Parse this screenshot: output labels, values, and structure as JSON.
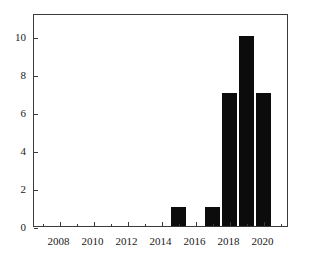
{
  "chart_data": {
    "type": "bar",
    "title": "",
    "subtitle": "",
    "xlabel": "",
    "ylabel": "",
    "categories": [
      2015,
      2017,
      2018,
      2019,
      2020
    ],
    "values": [
      1,
      1,
      7,
      10,
      7
    ],
    "series": [
      {
        "name": "count",
        "values": [
          1,
          1,
          7,
          10,
          7
        ]
      }
    ],
    "bars": [
      {
        "x": 2015,
        "value": 1
      },
      {
        "x": 2017,
        "value": 1
      },
      {
        "x": 2018,
        "value": 7
      },
      {
        "x": 2019,
        "value": 10
      },
      {
        "x": 2020,
        "value": 7
      }
    ],
    "xlim": [
      2006.5,
      2021.5
    ],
    "ylim": [
      0,
      11.2
    ],
    "xticks": [
      2008,
      2010,
      2012,
      2014,
      2016,
      2018,
      2020
    ],
    "xtick_labels": [
      "2008",
      "2010",
      "2012",
      "2014",
      "2016",
      "2018",
      "2020"
    ],
    "xticks_minor": [
      2007,
      2009,
      2011,
      2013,
      2015,
      2017,
      2019,
      2021
    ],
    "yticks": [
      0,
      2,
      4,
      6,
      8,
      10
    ],
    "ytick_labels": [
      "0",
      "2",
      "4",
      "6",
      "8",
      "10"
    ],
    "grid": false,
    "legend": null,
    "bar_color": "#0c0c0c",
    "axis_color": "#3a3a3a",
    "background_color": "#ffffff",
    "bar_width_years": 0.85
  }
}
